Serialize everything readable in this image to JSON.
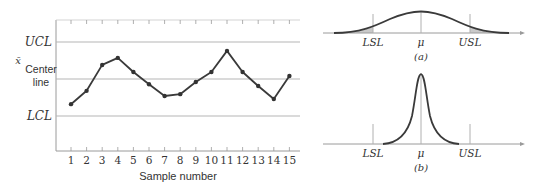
{
  "control_chart": {
    "y_symbol": "x̄",
    "ucl_label": "UCL",
    "center_label_1": "Center",
    "center_label_2": "line",
    "lcl_label": "LCL",
    "xlabel": "Sample number",
    "samples": [
      1,
      2,
      3,
      4,
      5,
      6,
      7,
      8,
      9,
      10,
      11,
      12,
      13,
      14,
      15
    ]
  },
  "panel_a": {
    "lsl": "LSL",
    "mu": "μ",
    "usl": "USL",
    "caption": "(a)"
  },
  "panel_b": {
    "lsl": "LSL",
    "mu": "μ",
    "usl": "USL",
    "caption": "(b)"
  },
  "chart_data": [
    {
      "type": "line",
      "title": "x̄ control chart",
      "xlabel": "Sample number",
      "ylabel": "x̄",
      "x": [
        1,
        2,
        3,
        4,
        5,
        6,
        7,
        8,
        9,
        10,
        11,
        12,
        13,
        14,
        15
      ],
      "series": [
        {
          "name": "sample mean (relative: LCL=-1, center=0, UCL=+1)",
          "values": [
            -0.68,
            -0.32,
            0.38,
            0.57,
            0.19,
            -0.14,
            -0.46,
            -0.41,
            -0.08,
            0.19,
            0.76,
            0.19,
            -0.19,
            -0.54,
            0.08
          ]
        }
      ],
      "reference_lines": [
        {
          "label": "UCL",
          "value": 1
        },
        {
          "label": "Center line",
          "value": 0
        },
        {
          "label": "LCL",
          "value": -1
        }
      ],
      "ylim": [
        -1.95,
        1.6
      ],
      "grid": false
    },
    {
      "type": "area",
      "title": "(a)",
      "description": "Wide normal distribution centered at μ; tails exceed LSL and USL (shaded)",
      "x_ticks": [
        "LSL",
        "μ",
        "USL"
      ]
    },
    {
      "type": "area",
      "title": "(b)",
      "description": "Narrow peaked distribution centered at μ; entirely within LSL and USL",
      "x_ticks": [
        "LSL",
        "μ",
        "USL"
      ]
    }
  ]
}
